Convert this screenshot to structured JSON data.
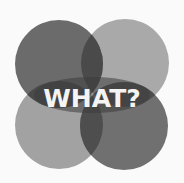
{
  "graphic": {
    "label": "WHAT?",
    "circles": [
      {
        "name": "top-left",
        "color": "#6a6a6a"
      },
      {
        "name": "top-right",
        "color": "#a8a8a8"
      },
      {
        "name": "bottom-left",
        "color": "#a0a0a0"
      },
      {
        "name": "bottom-right",
        "color": "#6e6e6e"
      }
    ],
    "overlap_color": "#454545"
  }
}
